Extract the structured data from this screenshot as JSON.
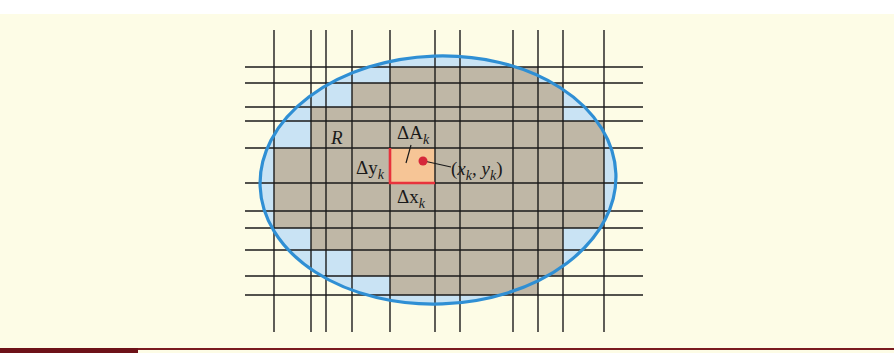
{
  "figure": {
    "region_label": "R",
    "area_label": {
      "main": "ΔA",
      "sub": "k"
    },
    "dy_label": {
      "main": "Δy",
      "sub": "k"
    },
    "dx_label": {
      "main": "Δx",
      "sub": "k"
    },
    "point_label": {
      "open": "(",
      "x": "x",
      "xsub": "k",
      "comma": ", ",
      "y": "y",
      "ysub": "k",
      "close": ")"
    }
  },
  "colors": {
    "background": "#fdfce6",
    "region_fill": "#c9e3f4",
    "boundary": "#2f8fd4",
    "inner_cells": "#bfb7a6",
    "highlight_cell": "#f6c596",
    "highlight_border": "#e8323c",
    "point": "#d6283a",
    "grid": "#1a1a1a",
    "footer_bar": "#7a1a1f"
  }
}
